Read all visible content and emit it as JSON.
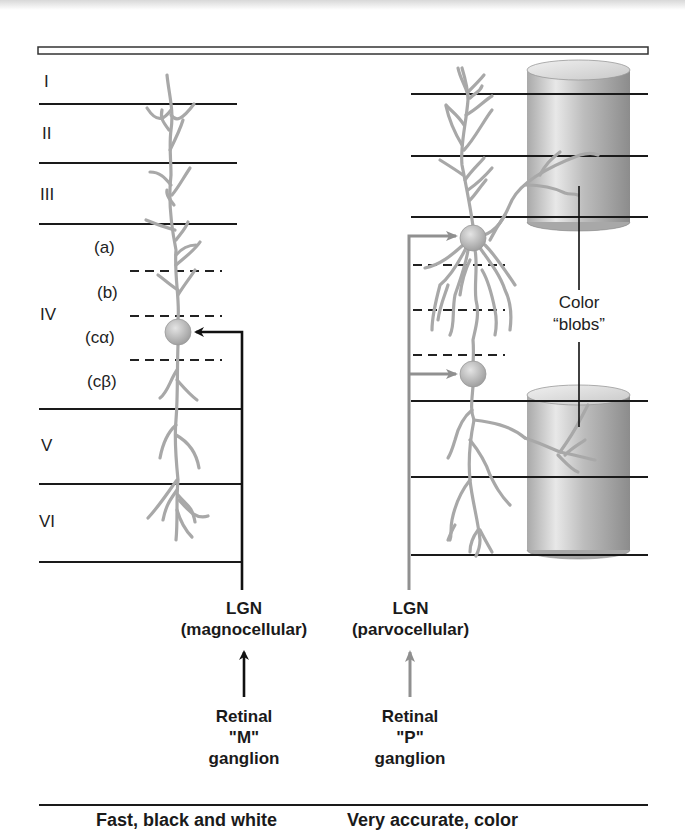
{
  "layers": {
    "left": [
      "I",
      "II",
      "III",
      "IV",
      "V",
      "VI"
    ],
    "sublayers": [
      "(a)",
      "(b)",
      "(cα)",
      "(cβ)"
    ]
  },
  "blobs_label": {
    "line1": "Color",
    "line2": "“blobs”"
  },
  "pathways": {
    "magno": {
      "lgn_title": "LGN",
      "lgn_sub": "(magnocellular)",
      "retina_1": "Retinal",
      "retina_2": "\"M\"",
      "retina_3": "ganglion",
      "color": "#111111",
      "caption": "Fast, black and white"
    },
    "parvo": {
      "lgn_title": "LGN",
      "lgn_sub": "(parvocellular)",
      "retina_1": "Retinal",
      "retina_2": "\"P\"",
      "retina_3": "ganglion",
      "color": "#9a9a9a",
      "caption": "Very accurate, color"
    }
  },
  "colors": {
    "dendrite": "#a8a8a8",
    "line": "#1a1a1a",
    "cylinder_light": "#e6e6e6",
    "cylinder_dark": "#8e8e8e"
  }
}
